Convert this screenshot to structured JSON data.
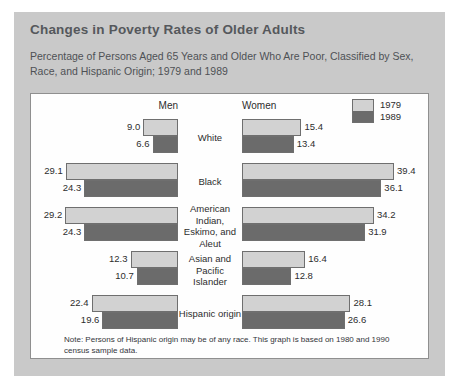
{
  "card": {
    "title": "Changes in Poverty Rates of Older Adults",
    "subtitle": "Percentage of Persons Aged 65 Years and Older Who Are Poor, Classified by Sex, Race, and Hispanic Origin; 1979 and 1989",
    "note": "Note: Persons of Hispanic origin may be of any race. This graph is based on 1980 and 1990 census sample data."
  },
  "headers": {
    "men": "Men",
    "women": "Women"
  },
  "legend": {
    "items": [
      "1979",
      "1989"
    ]
  },
  "colors": {
    "card_bg": "#c9c9c9",
    "panel_bg": "#fefefe",
    "bar_1979": "#d2d2d2",
    "bar_1989": "#6b6b6b",
    "bar_border": "#6f6f6f",
    "title": "#55585c",
    "text": "#2d2d2d"
  },
  "chart_data": {
    "type": "bar",
    "title": "Changes in Poverty Rates of Older Adults",
    "subtitle": "Percentage of Persons Aged 65 Years and Older Who Are Poor, Classified by Sex, Race, and Hispanic Origin; 1979 and 1989",
    "xlabel": "Percentage poor",
    "ylabel": "",
    "orientation": "horizontal",
    "layout": "bidirectional-pyramid",
    "grid": false,
    "legend": [
      "1979",
      "1989"
    ],
    "legend_position": "top-right",
    "axis_max": 40,
    "panels": [
      "Men",
      "Women"
    ],
    "categories": [
      "White",
      "Black",
      "American Indian, Eskimo, and Aleut",
      "Asian and Pacific Islander",
      "Hispanic origin"
    ],
    "series": [
      {
        "name": "Men 1979",
        "panel": "Men",
        "year": "1979",
        "values": [
          9.0,
          29.1,
          29.2,
          12.3,
          22.4
        ]
      },
      {
        "name": "Men 1989",
        "panel": "Men",
        "year": "1989",
        "values": [
          6.6,
          24.3,
          24.3,
          10.7,
          19.6
        ]
      },
      {
        "name": "Women 1979",
        "panel": "Women",
        "year": "1979",
        "values": [
          15.4,
          39.4,
          34.2,
          16.4,
          28.1
        ]
      },
      {
        "name": "Women 1989",
        "panel": "Women",
        "year": "1989",
        "values": [
          13.4,
          36.1,
          31.9,
          12.8,
          26.6
        ]
      }
    ],
    "note": "Note: Persons of Hispanic origin may be of any race. This graph is based on 1980 and 1990 census sample data."
  }
}
